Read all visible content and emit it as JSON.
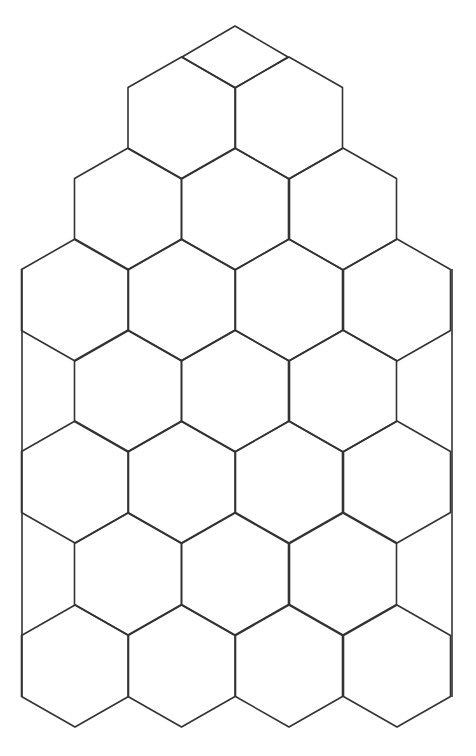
{
  "diagram": {
    "type": "hexagonal-grid",
    "stroke_color": "#333333",
    "background": "#ffffff",
    "hex": {
      "half_width": 53.5,
      "half_side": 30.5,
      "apex": 61
    },
    "top_diamond": [
      [
        182,
        57
      ],
      [
        235,
        26
      ],
      [
        288,
        57
      ],
      [
        235,
        88
      ]
    ],
    "rows": [
      {
        "cy": 118,
        "cx": [
          181.5,
          289
        ]
      },
      {
        "cy": 209,
        "cx": [
          128,
          235,
          343
        ]
      },
      {
        "cy": 300,
        "cx": [
          75,
          181.5,
          289,
          397
        ]
      },
      {
        "cy": 391,
        "cx": [
          128,
          235,
          343
        ]
      },
      {
        "cy": 482,
        "cx": [
          75,
          181.5,
          289,
          397
        ]
      },
      {
        "cy": 574,
        "cx": [
          128,
          235,
          343
        ]
      },
      {
        "cy": 666,
        "cx": [
          75,
          181.5,
          289,
          397
        ]
      }
    ],
    "boundary_lines": [
      {
        "x1": 22,
        "y1": 269,
        "x2": 22,
        "y2": 697
      },
      {
        "x1": 452,
        "y1": 269,
        "x2": 452,
        "y2": 697
      }
    ],
    "cell_count_full": 23
  }
}
